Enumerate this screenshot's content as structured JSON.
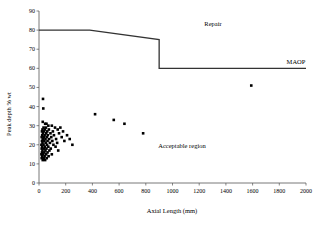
{
  "chart_data": {
    "type": "scatter",
    "title": "",
    "xlabel": "Axial Length (mm)",
    "ylabel": "Peak depth % wt",
    "xlim": [
      0,
      2000
    ],
    "ylim": [
      0,
      90
    ],
    "xticks": [
      0,
      200,
      400,
      600,
      800,
      1000,
      1200,
      1400,
      1600,
      1800,
      2000
    ],
    "yticks": [
      0,
      10,
      20,
      30,
      40,
      50,
      60,
      70,
      80,
      90
    ],
    "grid": false,
    "legend": "none",
    "marker_color": "#000000",
    "line_color": "#333333",
    "annotations": [
      {
        "text": "Repair",
        "x": 1220,
        "y": 84
      },
      {
        "text": "MAOP",
        "x": 1940,
        "y": 62
      },
      {
        "text": "Acceptable region",
        "x": 950,
        "y": 25
      }
    ],
    "series": [
      {
        "name": "Acceptance curve",
        "type": "line",
        "x": [
          0,
          380,
          900,
          900,
          2000
        ],
        "y": [
          80,
          80,
          75,
          60,
          60
        ]
      },
      {
        "name": "Defect measurements",
        "type": "scatter",
        "points": [
          [
            30,
            44
          ],
          [
            32,
            39
          ],
          [
            28,
            32
          ],
          [
            46,
            31
          ],
          [
            56,
            31
          ],
          [
            70,
            30
          ],
          [
            96,
            30
          ],
          [
            34,
            29
          ],
          [
            52,
            29
          ],
          [
            120,
            29
          ],
          [
            160,
            29
          ],
          [
            26,
            28
          ],
          [
            44,
            28
          ],
          [
            74,
            28
          ],
          [
            140,
            28
          ],
          [
            22,
            27
          ],
          [
            38,
            27
          ],
          [
            62,
            27
          ],
          [
            104,
            27
          ],
          [
            180,
            27
          ],
          [
            30,
            26
          ],
          [
            54,
            26
          ],
          [
            86,
            26
          ],
          [
            150,
            26
          ],
          [
            24,
            25
          ],
          [
            42,
            25
          ],
          [
            66,
            25
          ],
          [
            112,
            25
          ],
          [
            210,
            25
          ],
          [
            20,
            24
          ],
          [
            36,
            24
          ],
          [
            58,
            24
          ],
          [
            92,
            24
          ],
          [
            170,
            24
          ],
          [
            28,
            23
          ],
          [
            48,
            23
          ],
          [
            76,
            23
          ],
          [
            128,
            23
          ],
          [
            230,
            23
          ],
          [
            22,
            22
          ],
          [
            40,
            22
          ],
          [
            64,
            22
          ],
          [
            100,
            22
          ],
          [
            190,
            22
          ],
          [
            26,
            21
          ],
          [
            50,
            21
          ],
          [
            82,
            21
          ],
          [
            136,
            21
          ],
          [
            18,
            20
          ],
          [
            34,
            20
          ],
          [
            60,
            20
          ],
          [
            108,
            20
          ],
          [
            250,
            20
          ],
          [
            24,
            19
          ],
          [
            44,
            19
          ],
          [
            70,
            19
          ],
          [
            124,
            19
          ],
          [
            20,
            18
          ],
          [
            38,
            18
          ],
          [
            56,
            18
          ],
          [
            88,
            18
          ],
          [
            26,
            17
          ],
          [
            48,
            17
          ],
          [
            78,
            17
          ],
          [
            144,
            17
          ],
          [
            22,
            16
          ],
          [
            40,
            16
          ],
          [
            64,
            16
          ],
          [
            18,
            15
          ],
          [
            32,
            15
          ],
          [
            54,
            15
          ],
          [
            96,
            15
          ],
          [
            24,
            14
          ],
          [
            42,
            14
          ],
          [
            72,
            14
          ],
          [
            20,
            13
          ],
          [
            36,
            13
          ],
          [
            58,
            13
          ],
          [
            28,
            12
          ],
          [
            46,
            12
          ],
          [
            420,
            36
          ],
          [
            560,
            33
          ],
          [
            640,
            31
          ],
          [
            780,
            26
          ],
          [
            1590,
            51
          ]
        ]
      }
    ]
  }
}
